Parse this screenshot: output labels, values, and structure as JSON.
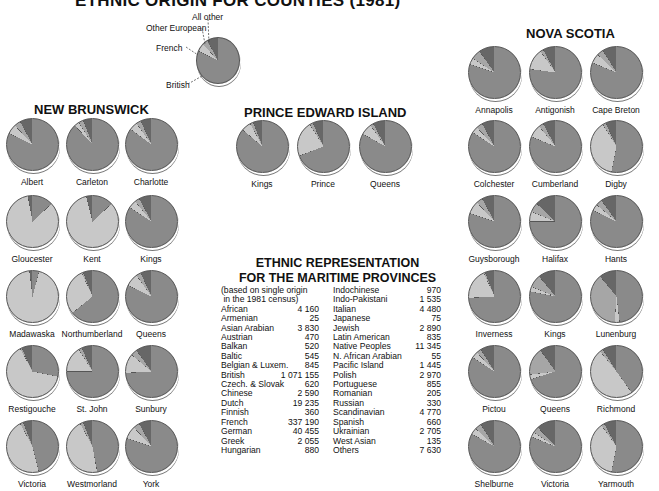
{
  "title": "ETHNIC ORIGIN FOR COUNTIES (1981)",
  "legend": {
    "all_other": "All  other",
    "other_european": "Other European",
    "french": "French",
    "british": "British"
  },
  "colors": {
    "british": "#8a8a8a",
    "french": "#c8c8c8",
    "other_european": "#a6a6a6",
    "all_other": "#676767",
    "edge": "#555555"
  },
  "provinces": {
    "new_brunswick": "NEW BRUNSWICK",
    "pei": "PRINCE EDWARD ISLAND",
    "nova_scotia": "NOVA SCOTIA"
  },
  "table": {
    "title_line1": "ETHNIC REPRESENTATION",
    "title_line2": "FOR THE MARITIME PROVINCES",
    "note_line1": "(based on single origin",
    "note_line2": " in the 1981 census)",
    "left": [
      [
        "African",
        "4 160"
      ],
      [
        "Armenian",
        "25"
      ],
      [
        "Asian Arabian",
        "3 830"
      ],
      [
        "Austrian",
        "470"
      ],
      [
        "Balkan",
        "520"
      ],
      [
        "Baltic",
        "545"
      ],
      [
        "Belgian & Luxem.",
        "845"
      ],
      [
        "British",
        "1 071 155"
      ],
      [
        "Czech. & Slovak",
        "620"
      ],
      [
        "Chinese",
        "2 590"
      ],
      [
        "Dutch",
        "19 235"
      ],
      [
        "Finnish",
        "360"
      ],
      [
        "French",
        "337 190"
      ],
      [
        "German",
        "40 455"
      ],
      [
        "Greek",
        "2 055"
      ],
      [
        "Hungarian",
        "880"
      ]
    ],
    "right": [
      [
        "Indochinese",
        "970"
      ],
      [
        "Indo-Pakistani",
        "1 535"
      ],
      [
        "Italian",
        "4 480"
      ],
      [
        "Japanese",
        "75"
      ],
      [
        "Jewish",
        "2 890"
      ],
      [
        "Latin American",
        "835"
      ],
      [
        "Native Peoples",
        "11 345"
      ],
      [
        "N. African Arabian",
        "55"
      ],
      [
        "Pacific Island",
        "1 445"
      ],
      [
        "Polish",
        "2 970"
      ],
      [
        "Portuguese",
        "855"
      ],
      [
        "Romanian",
        "205"
      ],
      [
        "Russian",
        "330"
      ],
      [
        "Scandinavian",
        "4 770"
      ],
      [
        "Spanish",
        "660"
      ],
      [
        "Ukrainian",
        "2 705"
      ],
      [
        "West Asian",
        "135"
      ],
      [
        "Others",
        "7 630"
      ]
    ]
  },
  "chart_data": {
    "type": "pie",
    "title": "ETHNIC ORIGIN FOR COUNTIES (1981)",
    "categories": [
      "British",
      "French",
      "Other European",
      "All other"
    ],
    "note": "Approximate shares (%) estimated from pie slice angles",
    "legend_pie": {
      "British": 82,
      "French": 6,
      "Other European": 4,
      "All other": 8
    },
    "series": [
      {
        "province": "New Brunswick",
        "county": "Albert",
        "British": 82,
        "French": 6,
        "Other European": 4,
        "All other": 8
      },
      {
        "province": "New Brunswick",
        "county": "Carleton",
        "British": 88,
        "French": 3,
        "Other European": 3,
        "All other": 6
      },
      {
        "province": "New Brunswick",
        "county": "Charlotte",
        "British": 85,
        "French": 5,
        "Other European": 3,
        "All other": 7
      },
      {
        "province": "New Brunswick",
        "county": "Gloucester",
        "British": 13,
        "French": 84,
        "Other European": 0,
        "All other": 3
      },
      {
        "province": "New Brunswick",
        "county": "Kent",
        "British": 13,
        "French": 83,
        "Other European": 0,
        "All other": 4
      },
      {
        "province": "New Brunswick",
        "county": "Kings",
        "British": 84,
        "French": 5,
        "Other European": 3,
        "All other": 8
      },
      {
        "province": "New Brunswick",
        "county": "Madawaska",
        "British": 4,
        "French": 94,
        "Other European": 0,
        "All other": 2
      },
      {
        "province": "New Brunswick",
        "county": "Northumberland",
        "British": 64,
        "French": 29,
        "Other European": 1,
        "All other": 6
      },
      {
        "province": "New Brunswick",
        "county": "Queens",
        "British": 82,
        "French": 8,
        "Other European": 3,
        "All other": 7
      },
      {
        "province": "New Brunswick",
        "county": "Restigouche",
        "British": 28,
        "French": 64,
        "Other European": 1,
        "All other": 7
      },
      {
        "province": "New Brunswick",
        "county": "St. John",
        "British": 75,
        "French": 16,
        "Other European": 2,
        "All other": 7
      },
      {
        "province": "New Brunswick",
        "county": "Sunbury",
        "British": 74,
        "French": 12,
        "Other European": 4,
        "All other": 10
      },
      {
        "province": "New Brunswick",
        "county": "Victoria",
        "British": 46,
        "French": 46,
        "Other European": 2,
        "All other": 6
      },
      {
        "province": "New Brunswick",
        "county": "Westmorland",
        "British": 47,
        "French": 45,
        "Other European": 2,
        "All other": 6
      },
      {
        "province": "New Brunswick",
        "county": "York",
        "British": 80,
        "French": 8,
        "Other European": 4,
        "All other": 8
      },
      {
        "province": "Prince Edward Island",
        "county": "Kings",
        "British": 86,
        "French": 6,
        "Other European": 2,
        "All other": 6
      },
      {
        "province": "Prince Edward Island",
        "county": "Prince",
        "British": 69,
        "French": 22,
        "Other European": 2,
        "All other": 7
      },
      {
        "province": "Prince Edward Island",
        "county": "Queens",
        "British": 83,
        "French": 7,
        "Other European": 2,
        "All other": 8
      },
      {
        "province": "Nova Scotia",
        "county": "Annapolis",
        "British": 80,
        "French": 4,
        "Other European": 6,
        "All other": 10
      },
      {
        "province": "Nova Scotia",
        "county": "Antigonish",
        "British": 77,
        "French": 13,
        "Other European": 2,
        "All other": 8
      },
      {
        "province": "Nova Scotia",
        "county": "Cape Breton",
        "British": 81,
        "French": 6,
        "Other European": 4,
        "All other": 9
      },
      {
        "province": "Nova Scotia",
        "county": "Colchester",
        "British": 84,
        "French": 4,
        "Other European": 4,
        "All other": 8
      },
      {
        "province": "Nova Scotia",
        "county": "Cumberland",
        "British": 81,
        "French": 8,
        "Other European": 3,
        "All other": 8
      },
      {
        "province": "Nova Scotia",
        "county": "Digby",
        "British": 53,
        "French": 38,
        "Other European": 2,
        "All other": 7
      },
      {
        "province": "Nova Scotia",
        "county": "Guysborough",
        "British": 80,
        "French": 8,
        "Other European": 4,
        "All other": 8
      },
      {
        "province": "Nova Scotia",
        "county": "Halifax",
        "British": 75,
        "French": 6,
        "Other European": 6,
        "All other": 13
      },
      {
        "province": "Nova Scotia",
        "county": "Hants",
        "British": 82,
        "French": 4,
        "Other European": 4,
        "All other": 10
      },
      {
        "province": "Nova Scotia",
        "county": "Inverness",
        "British": 74,
        "French": 19,
        "Other European": 1,
        "All other": 6
      },
      {
        "province": "Nova Scotia",
        "county": "Kings",
        "British": 78,
        "French": 3,
        "Other European": 8,
        "All other": 11
      },
      {
        "province": "Nova Scotia",
        "county": "Lunenburg",
        "British": 48,
        "French": 3,
        "Other European": 38,
        "All other": 11
      },
      {
        "province": "Nova Scotia",
        "county": "Pictou",
        "British": 84,
        "French": 4,
        "Other European": 3,
        "All other": 9
      },
      {
        "province": "Nova Scotia",
        "county": "Queens",
        "British": 70,
        "French": 3,
        "Other European": 17,
        "All other": 10
      },
      {
        "province": "Nova Scotia",
        "county": "Richmond",
        "British": 40,
        "French": 49,
        "Other European": 2,
        "All other": 9
      },
      {
        "province": "Nova Scotia",
        "county": "Shelburne",
        "British": 83,
        "French": 4,
        "Other European": 4,
        "All other": 9
      },
      {
        "province": "Nova Scotia",
        "county": "Victoria",
        "British": 81,
        "French": 3,
        "Other European": 4,
        "All other": 12
      },
      {
        "province": "Nova Scotia",
        "county": "Yarmouth",
        "British": 53,
        "French": 37,
        "Other European": 2,
        "All other": 8
      }
    ]
  }
}
